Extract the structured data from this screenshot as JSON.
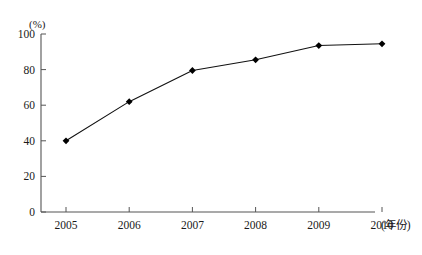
{
  "chart_data": {
    "type": "line",
    "title": "",
    "subtitle": "",
    "xlabel": "(年份)",
    "ylabel": "(%)",
    "categories": [
      "2005",
      "2006",
      "2007",
      "2008",
      "2009",
      "2010"
    ],
    "values": [
      40,
      62,
      79.5,
      85.5,
      93.5,
      94.5
    ],
    "series": [
      {
        "name": "",
        "values": [
          40,
          62,
          79.5,
          85.5,
          93.5,
          94.5
        ]
      }
    ],
    "xlim": [
      2005,
      2010
    ],
    "ylim": [
      0,
      100
    ],
    "ytick_labels": [
      "0",
      "20",
      "40",
      "60",
      "80",
      "100"
    ],
    "ytick_values": [
      0,
      20,
      40,
      60,
      80,
      100
    ],
    "xtick_labels": [
      "2005",
      "2006",
      "2007",
      "2008",
      "2009",
      "2010"
    ],
    "grid": false,
    "legend": false,
    "legend_position": "none",
    "marker": "diamond",
    "line_color": "#111111",
    "marker_color": "#000000",
    "axis_color": "#555555",
    "background_color": "#ffffff"
  },
  "axes": {
    "y_unit": "(%)",
    "x_unit": "(年份)"
  },
  "ticks": {
    "y": [
      {
        "label": "100",
        "value": 100
      },
      {
        "label": "80",
        "value": 80
      },
      {
        "label": "60",
        "value": 60
      },
      {
        "label": "40",
        "value": 40
      },
      {
        "label": "20",
        "value": 20
      },
      {
        "label": "0",
        "value": 0
      }
    ],
    "x": [
      {
        "label": "2005",
        "value": 40
      },
      {
        "label": "2006",
        "value": 62
      },
      {
        "label": "2007",
        "value": 79.5
      },
      {
        "label": "2008",
        "value": 85.5
      },
      {
        "label": "2009",
        "value": 93.5
      },
      {
        "label": "2010",
        "value": 94.5
      }
    ]
  }
}
